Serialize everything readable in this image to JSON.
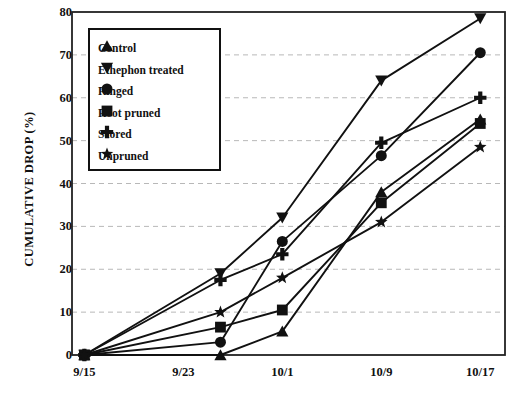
{
  "chart_data": {
    "type": "line",
    "title": "",
    "subtitle": "",
    "xlabel": "",
    "ylabel": "CUMULATIVE DROP (%)",
    "x": [
      "9/15",
      "9/26",
      "10/1",
      "10/9",
      "10/17"
    ],
    "x_tick_labels": [
      "9/15",
      "9/23",
      "10/1",
      "10/9",
      "10/17"
    ],
    "x_tick_positions": [
      0,
      8,
      16,
      24,
      32
    ],
    "x_data_positions": [
      0,
      11,
      16,
      24,
      32
    ],
    "xlim": [
      -1,
      34
    ],
    "ylim": [
      0,
      80
    ],
    "y_ticks": [
      0,
      10,
      20,
      30,
      40,
      50,
      60,
      70,
      80
    ],
    "grid": "horizontal-dashed",
    "legend_position": "upper-left-inside",
    "series": [
      {
        "name": "Control",
        "marker": "triangle-up",
        "values": [
          0,
          0,
          5.5,
          38,
          55
        ]
      },
      {
        "name": "Ethephon treated",
        "marker": "triangle-down",
        "values": [
          0,
          19,
          32,
          64,
          78.5
        ]
      },
      {
        "name": "Ringed",
        "marker": "circle",
        "values": [
          0,
          3,
          26.5,
          46.5,
          70.5
        ]
      },
      {
        "name": "Root pruned",
        "marker": "square",
        "values": [
          0,
          6.5,
          10.5,
          35.5,
          54
        ]
      },
      {
        "name": "Scored",
        "marker": "plus",
        "values": [
          0,
          17.5,
          23.5,
          49.5,
          60
        ]
      },
      {
        "name": "Unpruned",
        "marker": "star",
        "values": [
          0,
          10,
          18,
          31,
          48.5
        ]
      }
    ],
    "colors": {
      "line": "#111111",
      "marker": "#111111",
      "grid": "#b8b8b8",
      "axis": "#222222",
      "background": "#ffffff"
    }
  },
  "legend": {
    "items": [
      {
        "label": "Control",
        "marker": "triangle-up-icon"
      },
      {
        "label": "Ethephon treated",
        "marker": "triangle-down-icon"
      },
      {
        "label": "Ringed",
        "marker": "circle-icon"
      },
      {
        "label": "Root pruned",
        "marker": "square-icon"
      },
      {
        "label": "Scored",
        "marker": "plus-icon"
      },
      {
        "label": "Unpruned",
        "marker": "star-icon"
      }
    ]
  }
}
